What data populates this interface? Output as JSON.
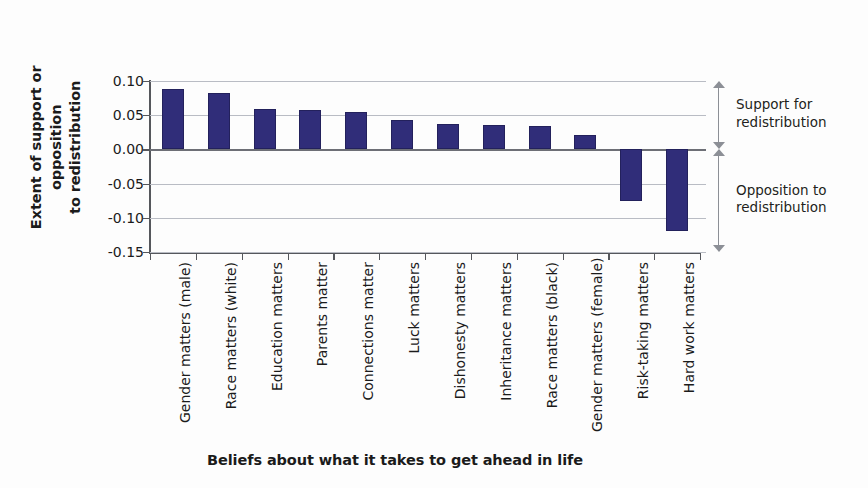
{
  "chart_data": {
    "type": "bar",
    "title": "",
    "xlabel": "Beliefs about what it takes to get ahead in life",
    "ylabel": "Extent of support or opposition to redistribution",
    "categories": [
      "Gender matters (male)",
      "Race matters (white)",
      "Education matters",
      "Parents matter",
      "Connections matter",
      "Luck matters",
      "Dishonesty matters",
      "Inheritance matters",
      "Race matters (black)",
      "Gender matters (female)",
      "Risk-taking matters",
      "Hard work matters"
    ],
    "values": [
      0.088,
      0.083,
      0.059,
      0.057,
      0.055,
      0.043,
      0.037,
      0.035,
      0.034,
      0.021,
      -0.075,
      -0.119
    ],
    "ylim": [
      -0.15,
      0.1
    ],
    "yticks": [
      0.1,
      0.05,
      0.0,
      -0.05,
      -0.1,
      -0.15
    ],
    "ytick_labels": [
      "0.10",
      "0.05",
      "0.00",
      "-0.05",
      "-0.10",
      "-0.15"
    ],
    "grid": true,
    "legend": "none",
    "bar_color": "#302d79",
    "annotations": [
      {
        "label": "Support for redistribution",
        "from": 0.1,
        "to": 0.0
      },
      {
        "label": "Opposition to redistribution",
        "from": 0.0,
        "to": -0.15
      }
    ]
  },
  "ytitle_line1": "Extent of support or opposition",
  "ytitle_line2": "to redistribution",
  "annotation_support_line1": "Support for",
  "annotation_support_line2": "redistribution",
  "annotation_opposition_line1": "Opposition to",
  "annotation_opposition_line2": "redistribution"
}
